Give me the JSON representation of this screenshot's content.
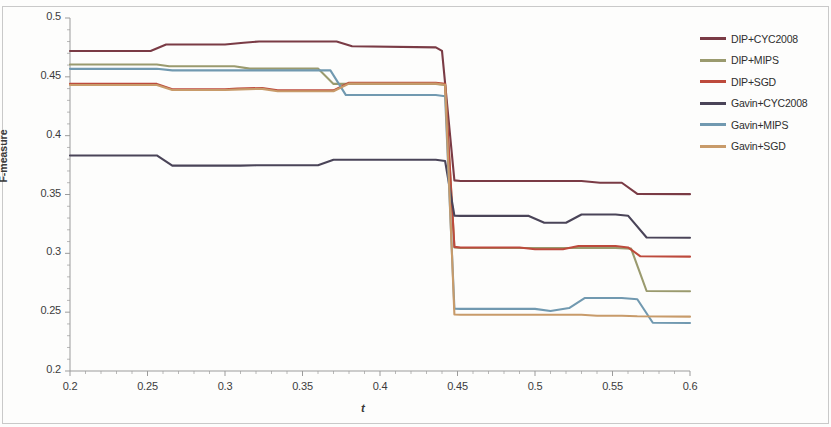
{
  "chart_data": {
    "type": "line",
    "title": "",
    "xlabel": "t",
    "ylabel": "F-measure",
    "xlim": [
      0.2,
      0.6
    ],
    "ylim": [
      0.2,
      0.5
    ],
    "xticks": [
      "0.2",
      "0.25",
      "0.3",
      "0.35",
      "0.4",
      "0.45",
      "0.5",
      "0.55",
      "0.6"
    ],
    "yticks": [
      "0.2",
      "0.25",
      "0.3",
      "0.35",
      "0.4",
      "0.45",
      "0.5"
    ],
    "xtick_values": [
      0.2,
      0.25,
      0.3,
      0.35,
      0.4,
      0.45,
      0.5,
      0.55,
      0.6
    ],
    "ytick_values": [
      0.2,
      0.25,
      0.3,
      0.35,
      0.4,
      0.45,
      0.5
    ],
    "minor_ticks": true,
    "grid": false,
    "legend_position": "right",
    "series": [
      {
        "name": "DIP+CYC2008",
        "color": "#7a3b45",
        "x": [
          0.2,
          0.252,
          0.262,
          0.3,
          0.312,
          0.322,
          0.372,
          0.382,
          0.436,
          0.44,
          0.448,
          0.452,
          0.53,
          0.542,
          0.556,
          0.566,
          0.6
        ],
        "values": [
          0.472,
          0.472,
          0.4775,
          0.4775,
          0.479,
          0.48,
          0.48,
          0.476,
          0.475,
          0.472,
          0.362,
          0.3615,
          0.3615,
          0.36,
          0.36,
          0.3505,
          0.3503
        ]
      },
      {
        "name": "DIP+MIPS",
        "color": "#9a9a6e",
        "x": [
          0.2,
          0.256,
          0.264,
          0.306,
          0.316,
          0.36,
          0.37,
          0.436,
          0.442,
          0.448,
          0.452,
          0.54,
          0.552,
          0.562,
          0.572,
          0.6
        ],
        "values": [
          0.4605,
          0.4605,
          0.459,
          0.459,
          0.457,
          0.457,
          0.444,
          0.444,
          0.443,
          0.305,
          0.3045,
          0.3045,
          0.3045,
          0.304,
          0.268,
          0.2678
        ]
      },
      {
        "name": "DIP+SGD",
        "color": "#bd4a3c",
        "x": [
          0.2,
          0.256,
          0.266,
          0.3,
          0.308,
          0.324,
          0.334,
          0.37,
          0.38,
          0.436,
          0.442,
          0.448,
          0.452,
          0.49,
          0.5,
          0.518,
          0.528,
          0.552,
          0.56,
          0.568,
          0.6
        ],
        "values": [
          0.444,
          0.444,
          0.4395,
          0.4395,
          0.44,
          0.4405,
          0.4385,
          0.4385,
          0.445,
          0.445,
          0.444,
          0.3055,
          0.305,
          0.305,
          0.3035,
          0.3035,
          0.3062,
          0.3062,
          0.305,
          0.2975,
          0.2972
        ]
      },
      {
        "name": "Gavin+CYC2008",
        "color": "#4a4458",
        "x": [
          0.2,
          0.256,
          0.266,
          0.31,
          0.32,
          0.36,
          0.37,
          0.436,
          0.442,
          0.448,
          0.452,
          0.496,
          0.506,
          0.52,
          0.53,
          0.552,
          0.56,
          0.572,
          0.6
        ],
        "values": [
          0.3832,
          0.3832,
          0.3745,
          0.3745,
          0.3748,
          0.3748,
          0.3795,
          0.3795,
          0.3785,
          0.332,
          0.3318,
          0.3318,
          0.326,
          0.326,
          0.333,
          0.333,
          0.332,
          0.3135,
          0.3133
        ]
      },
      {
        "name": "Gavin+MIPS",
        "color": "#7199b0",
        "x": [
          0.2,
          0.256,
          0.266,
          0.368,
          0.378,
          0.436,
          0.442,
          0.448,
          0.452,
          0.5,
          0.51,
          0.522,
          0.532,
          0.556,
          0.566,
          0.576,
          0.6
        ],
        "values": [
          0.4568,
          0.4568,
          0.4555,
          0.4555,
          0.4345,
          0.4345,
          0.4335,
          0.253,
          0.2528,
          0.2528,
          0.251,
          0.2535,
          0.262,
          0.262,
          0.261,
          0.241,
          0.2408
        ]
      },
      {
        "name": "Gavin+SGD",
        "color": "#c89b6a",
        "x": [
          0.2,
          0.256,
          0.266,
          0.3,
          0.31,
          0.324,
          0.334,
          0.37,
          0.38,
          0.436,
          0.442,
          0.448,
          0.452,
          0.53,
          0.54,
          0.556,
          0.566,
          0.6
        ],
        "values": [
          0.443,
          0.443,
          0.4388,
          0.4388,
          0.4393,
          0.4398,
          0.4378,
          0.4378,
          0.4442,
          0.4442,
          0.4432,
          0.248,
          0.2478,
          0.2478,
          0.247,
          0.247,
          0.2465,
          0.2462
        ]
      }
    ]
  },
  "legend": {
    "items": [
      {
        "label": "DIP+CYC2008",
        "color": "#7a3b45"
      },
      {
        "label": "DIP+MIPS",
        "color": "#9a9a6e"
      },
      {
        "label": "DIP+SGD",
        "color": "#bd4a3c"
      },
      {
        "label": "Gavin+CYC2008",
        "color": "#4a4458"
      },
      {
        "label": "Gavin+MIPS",
        "color": "#7199b0"
      },
      {
        "label": "Gavin+SGD",
        "color": "#c89b6a"
      }
    ]
  }
}
